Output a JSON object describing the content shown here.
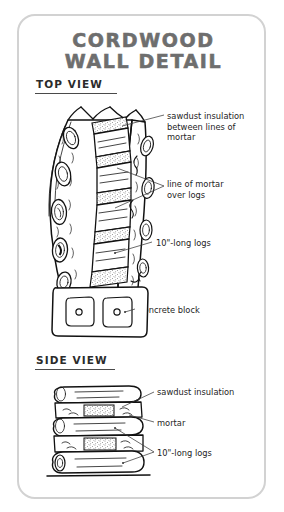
{
  "card": {
    "border_color": "#d2d2d2",
    "background": "#ffffff"
  },
  "header": {
    "title_line1": "CORDWOOD",
    "title_line2": "WALL DETAIL",
    "title_color": "#6e6e6e"
  },
  "sections": [
    {
      "heading": "TOP VIEW",
      "labels": [
        {
          "name": "sawdust-insulation",
          "text": "sawdust insulation\nbetween lines of\nmortar"
        },
        {
          "name": "line-of-mortar",
          "text": "line of mortar\nover logs"
        },
        {
          "name": "ten-inch-logs",
          "text": "10\"-long logs"
        },
        {
          "name": "concrete-block",
          "text": "concrete block"
        }
      ]
    },
    {
      "heading": "SIDE VIEW",
      "labels": [
        {
          "name": "sawdust-insulation",
          "text": "sawdust insulation"
        },
        {
          "name": "mortar",
          "text": "mortar"
        },
        {
          "name": "ten-inch-logs",
          "text": "10\"-long logs"
        }
      ]
    }
  ],
  "diagram": {
    "ink_color": "#111111",
    "leader_color": "#3a3a3a",
    "top_view": {
      "description": "curved cordwood wall seen from above, log ends visible at left, column of log tops with mortar and sawdust bands, concrete block footing at base",
      "mortar_bands": 5,
      "log_end_ellipses": 5,
      "concrete_block_cavities": 2
    },
    "side_view": {
      "description": "three stacked logs separated by two mortar layers with sawdust fill in the middle",
      "logs": 3,
      "mortar_layers": 2
    }
  }
}
